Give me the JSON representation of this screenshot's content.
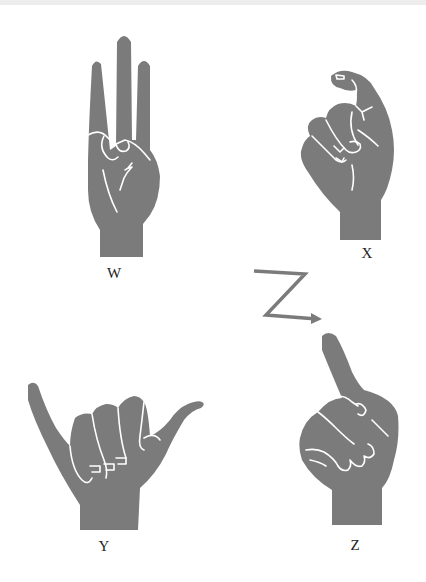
{
  "page": {
    "colors": {
      "hand_fill": "#7b7b7b",
      "outline": "#ffffff",
      "background": "#ffffff",
      "text": "#222222"
    }
  },
  "signs": [
    {
      "letter": "W",
      "description": "three extended fingers, thumb holding pinky"
    },
    {
      "letter": "X",
      "description": "index finger hooked, fist"
    },
    {
      "letter": "Y",
      "description": "thumb and pinky extended"
    },
    {
      "letter": "Z",
      "description": "index finger pointing up, traces Z"
    }
  ],
  "motion": {
    "icon": "z-motion-arrow-icon",
    "meaning": "trace the letter Z"
  }
}
